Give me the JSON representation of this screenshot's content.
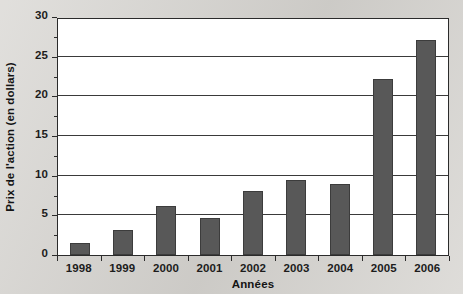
{
  "chart_data": {
    "type": "bar",
    "title": "",
    "subtitle": "",
    "xlabel": "Années",
    "ylabel": "Prix de l'action (en dollars)",
    "categories": [
      "1998",
      "1999",
      "2000",
      "2001",
      "2002",
      "2003",
      "2004",
      "2005",
      "2006"
    ],
    "values": [
      1.5,
      3.2,
      6.2,
      4.7,
      8.1,
      9.5,
      8.9,
      22.2,
      27.1
    ],
    "ylim": [
      0,
      30
    ],
    "ytick_step": 5,
    "yticks": [
      0,
      5,
      10,
      15,
      20,
      25,
      30
    ],
    "ytick_labels": [
      "0",
      "5",
      "10",
      "15",
      "20",
      "25",
      "30"
    ],
    "grid": true,
    "grid_axis": "y",
    "legend": false,
    "legend_position": "none",
    "series": [
      {
        "name": "Prix de l'action",
        "values": [
          1.5,
          3.2,
          6.2,
          4.7,
          8.1,
          9.5,
          8.9,
          22.2,
          27.1
        ]
      }
    ]
  },
  "colors": {
    "bar_fill": "#585858",
    "bar_border": "#3c3c3c",
    "plot_background": "#ffffff",
    "page_background": "#d7d5d1",
    "axis_line": "#2b2b2b",
    "gridline": "#3a3a3a",
    "text": "#1c1c1c"
  }
}
